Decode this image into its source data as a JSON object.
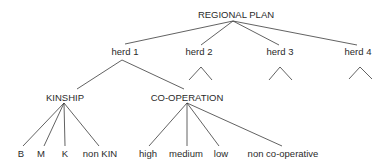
{
  "diagram": {
    "type": "tree",
    "root": {
      "label": "REGIONAL PLAN"
    },
    "level1": [
      {
        "label": "herd 1"
      },
      {
        "label": "herd 2"
      },
      {
        "label": "herd 3"
      },
      {
        "label": "herd 4"
      }
    ],
    "herd1_children": [
      {
        "label": "KINSHIP",
        "children": [
          "B",
          "M",
          "K",
          "non KIN"
        ]
      },
      {
        "label": "CO-OPERATION",
        "children": [
          "high",
          "medium",
          "low",
          "non co-operative"
        ]
      }
    ],
    "collapsed_subtrees": [
      "herd 2",
      "herd 3",
      "herd 4"
    ],
    "line_color": "#333333"
  }
}
